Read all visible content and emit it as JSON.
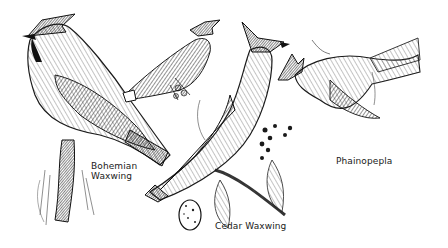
{
  "illustration": {
    "style": "black-and-white pen-and-ink",
    "background": "#ffffff",
    "ink": "#1a1a1a",
    "subjects": [
      {
        "id": "bohemian-waxwing-large",
        "species": "Bohemian Waxwing",
        "pose": "perched, facing left, large, on lichen-covered branch"
      },
      {
        "id": "bohemian-waxwing-small",
        "species": "Bohemian Waxwing",
        "pose": "perched on berry twig, facing right, upper center"
      },
      {
        "id": "cedar-waxwing",
        "species": "Cedar Waxwing",
        "pose": "perched on leafy branch with berries, facing right"
      },
      {
        "id": "phainopepla",
        "species": "Phainopepla",
        "pose": "flying/perching, facing left, upper right"
      },
      {
        "id": "egg",
        "species": "Cedar Waxwing egg",
        "pose": "speckled egg, bottom center"
      }
    ]
  },
  "labels": {
    "bohemian_line1": "Bohemian",
    "bohemian_line2": "Waxwing",
    "cedar": "Cedar Waxwing",
    "phainopepla": "Phainopepla"
  }
}
